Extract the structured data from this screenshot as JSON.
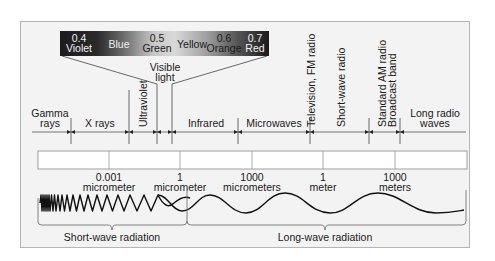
{
  "visible_spectrum": {
    "colors": [
      {
        "value": "0.4",
        "name": "Violet"
      },
      {
        "value": "",
        "name": "Blue"
      },
      {
        "value": "0.5",
        "name": "Green"
      },
      {
        "value": "",
        "name": "Yellow"
      },
      {
        "value": "0.6",
        "name": "Orange"
      },
      {
        "value": "0.7",
        "name": "Red"
      }
    ],
    "label_line1": "Visible",
    "label_line2": "light"
  },
  "bands": {
    "gamma_1": "Gamma",
    "gamma_2": "rays",
    "xrays": "X rays",
    "ultraviolet": "Ultraviolet",
    "infrared": "Infrared",
    "microwaves": "Microwaves",
    "tv_fm": "Television, FM radio",
    "shortwave": "Short-wave radio",
    "am_1": "Standard AM radio",
    "am_2": "Broadcast band",
    "long_1": "Long radio",
    "long_2": "waves"
  },
  "scale": [
    {
      "value": "0.001",
      "unit": "micrometer"
    },
    {
      "value": "1",
      "unit": "micrometer"
    },
    {
      "value": "1000",
      "unit": "micrometers"
    },
    {
      "value": "1",
      "unit": "meter"
    },
    {
      "value": "1000",
      "unit": "meters"
    }
  ],
  "radiation": {
    "short": "Short-wave radiation",
    "long": "Long-wave radiation"
  }
}
